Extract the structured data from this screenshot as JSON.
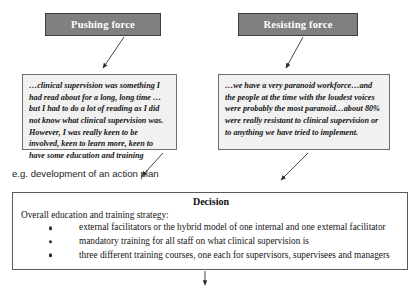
{
  "diagram": {
    "forces": [
      {
        "id": "pushing",
        "label": "Pushing force"
      },
      {
        "id": "resisting",
        "label": "Resisting force"
      }
    ],
    "quotes": [
      {
        "id": "pushing-quote",
        "text": "…clinical supervision was something I had read about for a long, long time …but I had to do a lot of reading as I did not know what clinical supervision was. However, I was really keen to be involved, keen to learn more, keen to have some education and training"
      },
      {
        "id": "resisting-quote",
        "text": "…we have a very paranoid workforce…and the people at the time with the loudest voices were probably the most paranoid…about 80% were really resistant to clinical supervision or to anything we have tried to implement."
      }
    ],
    "caption": "e.g. development of an action plan",
    "decision": {
      "title": "Decision",
      "intro": "Overall education and training strategy:",
      "bullets": [
        "external facilitators or the hybrid model of one internal and one external facilitator",
        "mandatory training for all staff on what clinical supervision is",
        "three different training courses, one each for supervisors, supervisees and managers"
      ]
    },
    "colors": {
      "force_box_fill": "#808080",
      "force_box_text": "#ffffff",
      "quote_box_fill": "#f1f1f1",
      "border": "#5a5a5a",
      "connector": "#3a3a3a"
    }
  }
}
